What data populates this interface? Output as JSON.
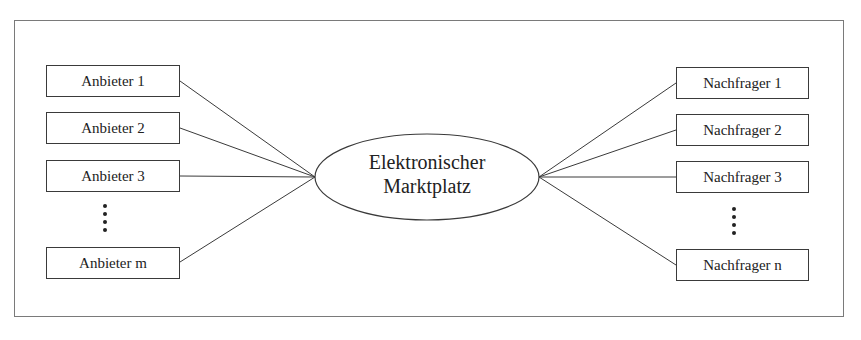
{
  "diagram": {
    "center": {
      "line1": "Elektronischer",
      "line2": "Marktplatz"
    },
    "suppliers": [
      {
        "label": "Anbieter 1"
      },
      {
        "label": "Anbieter 2"
      },
      {
        "label": "Anbieter 3"
      },
      {
        "label": "Anbieter m"
      }
    ],
    "buyers": [
      {
        "label": "Nachfrager 1"
      },
      {
        "label": "Nachfrager 2"
      },
      {
        "label": "Nachfrager 3"
      },
      {
        "label": "Nachfrager n"
      }
    ],
    "ellipsis_marker": "⋮",
    "colors": {
      "line": "#3a3a3a",
      "frame": "#7a7a7a",
      "text": "#222222"
    }
  }
}
